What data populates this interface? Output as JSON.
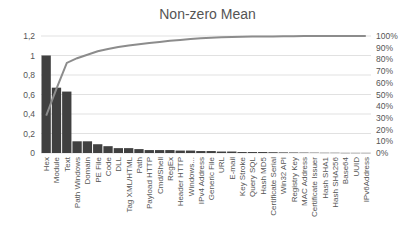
{
  "chart_data": {
    "type": "bar",
    "title": "Non-zero Mean",
    "xlabel": "",
    "ylabel": "",
    "ylim": [
      0,
      1.2
    ],
    "y2lim": [
      0,
      100
    ],
    "grid": true,
    "legend": "none",
    "yticks": [
      "0",
      "0,2",
      "0,4",
      "0,6",
      "0,8",
      "1",
      "1,2"
    ],
    "y2ticks": [
      "0%",
      "10%",
      "20%",
      "30%",
      "40%",
      "50%",
      "60%",
      "70%",
      "80%",
      "90%",
      "100%"
    ],
    "categories": [
      "Hex",
      "Module",
      "Text",
      "Path Windows",
      "Domain",
      "PE File",
      "Code",
      "DLL",
      "Tag XML/HTML",
      "Path",
      "Payload HTTP",
      "Cmd/Shell",
      "RegEx",
      "Header HTTP",
      "Windows...",
      "IPv4 Address",
      "Generic File",
      "URL",
      "E-mail",
      "Key Stroke",
      "Query SQL",
      "Hash MD5",
      "Certificate Serial",
      "Win32 API",
      "Registry Key",
      "MAC Address",
      "Certificate Issuer",
      "Hash SHA1",
      "Hash SHA256",
      "Base64",
      "UUID",
      "IPv6Address"
    ],
    "series": [
      {
        "name": "Non-zero Mean",
        "type": "bar",
        "axis": "left",
        "color": "#404040",
        "values": [
          1.0,
          0.67,
          0.63,
          0.12,
          0.12,
          0.09,
          0.07,
          0.05,
          0.05,
          0.04,
          0.03,
          0.03,
          0.03,
          0.025,
          0.025,
          0.02,
          0.02,
          0.015,
          0.015,
          0.01,
          0.01,
          0.01,
          0.008,
          0.006,
          0.005,
          0.004,
          0.003,
          0.002,
          0.002,
          0.001,
          0.001,
          0.001
        ]
      },
      {
        "name": "Cumulative %",
        "type": "line",
        "axis": "right",
        "color": "#8c8c8c",
        "values": [
          32,
          55,
          77,
          81,
          84,
          87,
          89,
          90.5,
          92,
          93,
          94,
          95,
          96,
          96.7,
          97.4,
          98,
          98.5,
          98.9,
          99.2,
          99.4,
          99.5,
          99.6,
          99.7,
          99.8,
          99.85,
          99.9,
          99.93,
          99.95,
          99.97,
          99.98,
          99.99,
          100
        ]
      }
    ]
  }
}
